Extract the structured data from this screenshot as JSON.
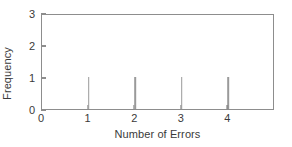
{
  "chart_data": {
    "type": "bar",
    "title": "",
    "subtitle": "",
    "xlabel": "Number of Errors",
    "ylabel": "Frequency",
    "categories": [
      "1",
      "2",
      "3",
      "4"
    ],
    "x": [
      1,
      2,
      3,
      4
    ],
    "values": [
      1,
      1,
      1,
      1
    ],
    "series": [
      {
        "name": "Frequency",
        "values": [
          1,
          1,
          1,
          1
        ]
      }
    ],
    "xlim": [
      0,
      5
    ],
    "ylim": [
      0,
      3
    ],
    "xticks": [
      0,
      1,
      2,
      3,
      4
    ],
    "yticks": [
      0,
      1,
      2,
      3
    ],
    "xtick_labels": [
      "0",
      "1",
      "2",
      "3",
      "4"
    ],
    "ytick_labels": [
      "0",
      "1",
      "2",
      "3"
    ],
    "grid": false,
    "legend": false,
    "legend_position": "none",
    "annotations": [],
    "style": {
      "bar_style": "spike",
      "bar_color": "#9a9a9a",
      "frame_color": "#8d8d8d",
      "text_color": "#3a3a3a",
      "background": "#ffffff"
    }
  }
}
